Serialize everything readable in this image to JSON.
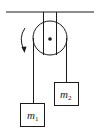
{
  "diagram": {
    "type": "atwood-machine",
    "stroke_color": "#1a1a1a",
    "ceiling": {
      "x1": 6,
      "x2": 94,
      "y": 12
    },
    "bracket": {
      "x_left": 43,
      "x_right": 56,
      "y_top": 12,
      "y_bottom": 30
    },
    "pulley": {
      "cx": 50,
      "cy": 38,
      "r": 17,
      "axle_r": 1.8
    },
    "rotation_arrow": {
      "direction": "counterclockwise",
      "icon": "curved-arrow"
    },
    "ropes": [
      {
        "x": 33,
        "y1": 38,
        "y2": 103
      },
      {
        "x": 67,
        "y1": 38,
        "y2": 82
      }
    ],
    "masses": [
      {
        "id": "m1",
        "label_main": "m",
        "label_sub": "1",
        "x": 20,
        "y": 103,
        "w": 25,
        "h": 24
      },
      {
        "id": "m2",
        "label_main": "m",
        "label_sub": "2",
        "x": 55,
        "y": 82,
        "w": 24,
        "h": 23
      }
    ]
  }
}
